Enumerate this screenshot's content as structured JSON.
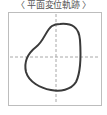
{
  "title": "〈 平面変位軌跡 〉",
  "plot": {
    "frame_color": "#bdbdbd",
    "axis_color": "#a8a8a8",
    "curve_color": "#3a3a3a",
    "curve_path": "M 60 24 C 72 23, 79 27, 80 40 C 81 55, 81 72, 76 82 C 71 90, 60 92, 51 90 C 40 88, 29 82, 26 72 C 24 63, 27 54, 36 47 C 44 41, 46 30, 52 26 C 55 24, 57 24, 60 24 Z"
  }
}
